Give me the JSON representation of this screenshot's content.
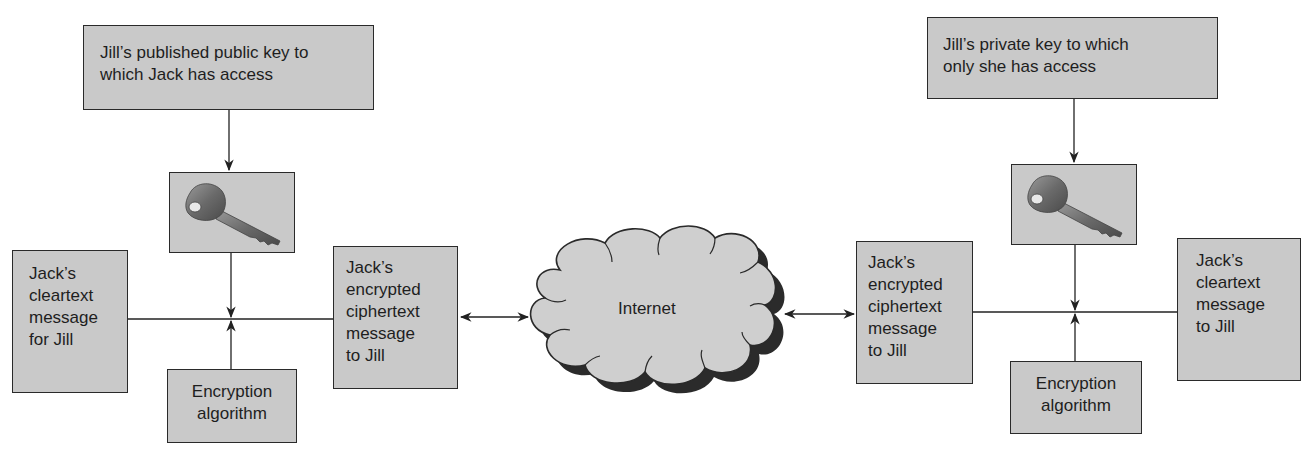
{
  "diagram": {
    "left": {
      "key_source": {
        "line1": "Jill’s published public key to",
        "line2": "which Jack has access"
      },
      "key_icon": "key-icon",
      "cleartext": {
        "lines": [
          "Jack’s",
          "cleartext",
          "message",
          "for Jill"
        ]
      },
      "algorithm": {
        "line1": "Encryption",
        "line2": "algorithm"
      },
      "ciphertext": {
        "lines": [
          "Jack’s",
          "encrypted",
          "ciphertext",
          "message",
          "to Jill"
        ]
      }
    },
    "network": {
      "label": "Internet",
      "icon": "cloud-icon"
    },
    "right": {
      "key_source": {
        "line1": "Jill’s private key to which",
        "line2": "only she has access"
      },
      "key_icon": "key-icon",
      "ciphertext": {
        "lines": [
          "Jack’s",
          "encrypted",
          "ciphertext",
          "message",
          "to Jill"
        ]
      },
      "algorithm": {
        "line1": "Encryption",
        "line2": "algorithm"
      },
      "cleartext": {
        "lines": [
          "Jack’s",
          "cleartext",
          "message",
          "to Jill"
        ]
      }
    },
    "colors": {
      "box_fill": "#c9c9c9",
      "box_border": "#2a2a2a",
      "line": "#222222",
      "shadow": "#2b2b2b"
    }
  }
}
